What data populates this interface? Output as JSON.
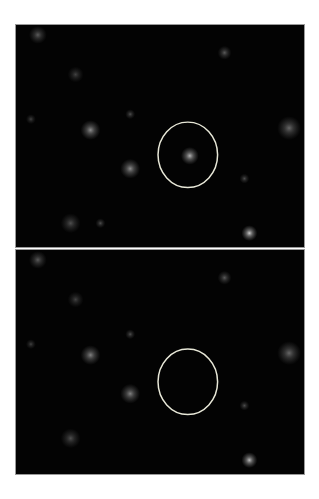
{
  "figure": {
    "panels": [
      {
        "id": "top",
        "description": "fluorescence micrograph with bright cell inside circled region",
        "circle": {
          "cx": 173,
          "cy": 131,
          "rx": 30,
          "ry": 33,
          "color": "#e8e8d8"
        },
        "blobs": [
          {
            "x": 22,
            "y": 10,
            "r": 9,
            "o": 0.35
          },
          {
            "x": 60,
            "y": 50,
            "r": 8,
            "o": 0.25
          },
          {
            "x": 75,
            "y": 106,
            "r": 10,
            "o": 0.55
          },
          {
            "x": 115,
            "y": 145,
            "r": 10,
            "o": 0.55
          },
          {
            "x": 175,
            "y": 132,
            "r": 9,
            "o": 0.7
          },
          {
            "x": 210,
            "y": 28,
            "r": 7,
            "o": 0.35
          },
          {
            "x": 275,
            "y": 104,
            "r": 12,
            "o": 0.4
          },
          {
            "x": 235,
            "y": 210,
            "r": 8,
            "o": 0.8
          },
          {
            "x": 55,
            "y": 200,
            "r": 10,
            "o": 0.3
          },
          {
            "x": 115,
            "y": 90,
            "r": 5,
            "o": 0.3
          },
          {
            "x": 85,
            "y": 200,
            "r": 5,
            "o": 0.3
          },
          {
            "x": 230,
            "y": 155,
            "r": 5,
            "o": 0.3
          },
          {
            "x": 15,
            "y": 95,
            "r": 5,
            "o": 0.25
          }
        ]
      },
      {
        "id": "bottom",
        "description": "fluorescence micrograph with circled region now dark",
        "circle": {
          "cx": 173,
          "cy": 133,
          "rx": 30,
          "ry": 33,
          "color": "#e8e8d8"
        },
        "blobs": [
          {
            "x": 22,
            "y": 10,
            "r": 9,
            "o": 0.35
          },
          {
            "x": 60,
            "y": 50,
            "r": 8,
            "o": 0.25
          },
          {
            "x": 75,
            "y": 106,
            "r": 10,
            "o": 0.5
          },
          {
            "x": 115,
            "y": 145,
            "r": 10,
            "o": 0.5
          },
          {
            "x": 210,
            "y": 28,
            "r": 7,
            "o": 0.35
          },
          {
            "x": 275,
            "y": 104,
            "r": 12,
            "o": 0.4
          },
          {
            "x": 235,
            "y": 212,
            "r": 8,
            "o": 0.75
          },
          {
            "x": 55,
            "y": 190,
            "r": 10,
            "o": 0.3
          },
          {
            "x": 115,
            "y": 85,
            "r": 5,
            "o": 0.3
          },
          {
            "x": 230,
            "y": 157,
            "r": 5,
            "o": 0.3
          },
          {
            "x": 15,
            "y": 95,
            "r": 5,
            "o": 0.25
          }
        ]
      }
    ]
  }
}
